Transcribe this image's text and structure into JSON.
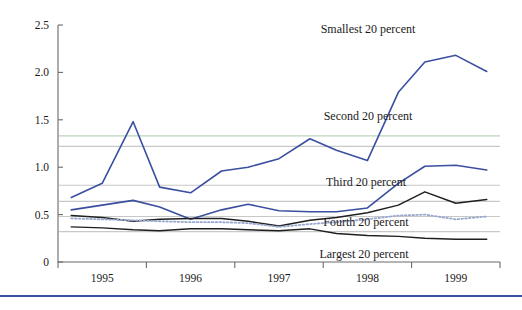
{
  "chart_data": {
    "type": "line",
    "title": "",
    "subtitle": "",
    "xlabel": "",
    "ylabel": "",
    "xlim": [
      1994.5,
      1999.5
    ],
    "ylim": [
      0,
      2.5
    ],
    "grid": "horizontal-reference-lines",
    "legend_position": "inline-annotations",
    "yticks": [
      "0",
      "0.5",
      "1.0",
      "1.5",
      "2.0",
      "2.5"
    ],
    "ytick_values": [
      0,
      0.5,
      1.0,
      1.5,
      2.0,
      2.5
    ],
    "xticks": [
      "1995",
      "1996",
      "1997",
      "1998",
      "1999"
    ],
    "xtick_values": [
      1995,
      1996,
      1997,
      1998,
      1999
    ],
    "x": [
      1994.65,
      1995.0,
      1995.35,
      1995.65,
      1996.0,
      1996.35,
      1996.65,
      1997.0,
      1997.35,
      1997.65,
      1998.0,
      1998.35,
      1998.65,
      1999.0,
      1999.35
    ],
    "reference_lines": [
      {
        "name": "Smallest 20 percent mean",
        "value": 1.33,
        "color": "#b9d6bd"
      },
      {
        "name": "Second 20 percent mean",
        "value": 1.22,
        "color": "#c8c8c8"
      },
      {
        "name": "Third 20 percent mean",
        "value": 0.81,
        "color": "#c8c8c8"
      },
      {
        "name": "Fourth 20 percent mean",
        "value": 0.64,
        "color": "#c8c8c8"
      },
      {
        "name": "Fifth reference",
        "value": 0.48,
        "color": "#c8c8c8"
      },
      {
        "name": "Largest 20 percent mean",
        "value": 0.32,
        "color": "#c8c8c8"
      }
    ],
    "series": [
      {
        "name": "Smallest 20 percent",
        "color": "#3b4fa0",
        "style": "solid",
        "width": 1.6,
        "values": [
          0.68,
          0.83,
          1.48,
          0.79,
          0.73,
          0.96,
          1.0,
          1.09,
          1.3,
          1.18,
          1.07,
          1.79,
          2.11,
          2.18,
          2.01
        ]
      },
      {
        "name": "Second 20 percent",
        "color": "#3b4fa0",
        "style": "solid",
        "width": 1.6,
        "values": [
          0.55,
          0.6,
          0.65,
          0.58,
          0.45,
          0.55,
          0.61,
          0.54,
          0.53,
          0.53,
          0.57,
          0.83,
          1.01,
          1.02,
          0.97
        ]
      },
      {
        "name": "Third 20 percent",
        "color": "#1f1f1f",
        "style": "solid",
        "width": 1.5,
        "values": [
          0.49,
          0.47,
          0.43,
          0.45,
          0.46,
          0.46,
          0.43,
          0.38,
          0.44,
          0.47,
          0.52,
          0.6,
          0.74,
          0.62,
          0.66
        ]
      },
      {
        "name": "Fourth 20 percent",
        "color": "#9aa8cf",
        "style": "dotted",
        "width": 1.8,
        "values": [
          0.46,
          0.45,
          0.44,
          0.43,
          0.42,
          0.42,
          0.41,
          0.37,
          0.4,
          0.42,
          0.45,
          0.49,
          0.5,
          0.45,
          0.48
        ]
      },
      {
        "name": "Largest 20 percent",
        "color": "#1f1f1f",
        "style": "solid",
        "width": 1.4,
        "values": [
          0.37,
          0.36,
          0.34,
          0.33,
          0.35,
          0.35,
          0.34,
          0.33,
          0.35,
          0.3,
          0.28,
          0.27,
          0.25,
          0.24,
          0.24
        ]
      }
    ],
    "annotations": [
      {
        "text": "Smallest 20 percent",
        "x_px": 368,
        "y_px": 33
      },
      {
        "text": "Second 20 percent",
        "x_px": 368,
        "y_px": 120
      },
      {
        "text": "Third 20 percent",
        "x_px": 366,
        "y_px": 186
      },
      {
        "text": "Fourth 20 percent",
        "x_px": 366,
        "y_px": 226
      },
      {
        "text": "Largest 20 percent",
        "x_px": 364,
        "y_px": 258
      }
    ],
    "colors": {
      "blue": "#3b4fa0",
      "black": "#1f1f1f",
      "dotted_blue": "#9aa8cf",
      "gridline": "#c8c8c8",
      "green_line": "#b9d6bd",
      "axis": "#6a6a6a",
      "footer_rule": "#3b4fa0"
    }
  },
  "footer": {
    "rule": true
  }
}
